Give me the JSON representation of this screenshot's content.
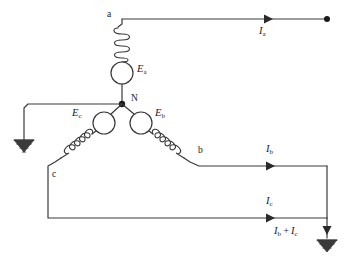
{
  "diagram": {
    "type": "circuit-schematic",
    "background_color": "#ffffff",
    "line_color": "#3a3a3a",
    "text_color": "#1a1a1a"
  },
  "terminals": [
    {
      "id": "a",
      "label": "a",
      "x": 107,
      "y": 17
    },
    {
      "id": "b",
      "label": "b",
      "x": 198,
      "y": 150
    },
    {
      "id": "c",
      "label": "c",
      "x": 52,
      "y": 176
    },
    {
      "id": "n",
      "label": "N",
      "x": 131,
      "y": 98
    }
  ],
  "sources": [
    {
      "id": "Ea",
      "symbol": "E",
      "subscript": "a",
      "label_x": 137,
      "label_y": 68,
      "cx": 122,
      "cy": 73,
      "r": 11
    },
    {
      "id": "Eb",
      "symbol": "E",
      "subscript": "b",
      "label_x": 155,
      "label_y": 112,
      "cx": 141,
      "cy": 123,
      "r": 11
    },
    {
      "id": "Ec",
      "symbol": "E",
      "subscript": "c",
      "label_x": 72,
      "label_y": 112,
      "cx": 104,
      "cy": 123,
      "r": 11
    }
  ],
  "currents": [
    {
      "id": "Ia",
      "symbol": "I",
      "subscript": "a",
      "label_x": 259,
      "label_y": 28,
      "arrow_x": 270,
      "arrow_y": 19
    },
    {
      "id": "Ib",
      "symbol": "I",
      "subscript": "b",
      "label_x": 266,
      "label_y": 146,
      "arrow_x": 274,
      "arrow_y": 166
    },
    {
      "id": "Ic",
      "symbol": "I",
      "subscript": "c",
      "label_x": 266,
      "label_y": 198,
      "arrow_x": 274,
      "arrow_y": 218
    },
    {
      "id": "Ib_plus_Ic",
      "symbol": "I",
      "subscript": "b",
      "symbol2": "I",
      "subscript2": "c",
      "operator": "+",
      "label_x": 274,
      "label_y": 228
    }
  ],
  "grounds": [
    {
      "id": "neutral-ground-left",
      "x": 24,
      "y": 140
    },
    {
      "id": "return-ground-right",
      "x": 327,
      "y": 238
    }
  ],
  "nodes": [
    {
      "id": "neutral-node",
      "x": 122,
      "y": 104
    },
    {
      "id": "phase-a-terminal-dot",
      "x": 327,
      "y": 19
    }
  ]
}
